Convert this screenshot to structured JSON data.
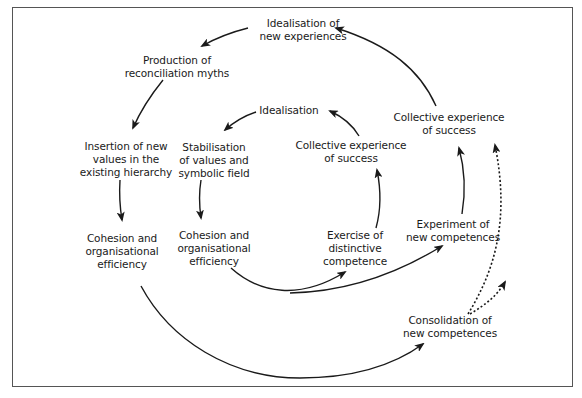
{
  "diagram": {
    "type": "cyclical process diagram (nested spirals)",
    "colors": {
      "stroke": "#1a1a1a",
      "border": "#555555",
      "background": "#ffffff"
    },
    "nodes": {
      "idealisation_new_exp": {
        "text": "Idealisation of\nnew experiences"
      },
      "production_myths": {
        "text": "Production of\nreconciliation myths"
      },
      "insertion_values": {
        "text": "Insertion of new\nvalues in the\nexisting hierarchy"
      },
      "cohesion_outer": {
        "text": "Cohesion and\norganisational\nefficiency"
      },
      "idealisation_inner": {
        "text": "Idealisation"
      },
      "stabilisation": {
        "text": "Stabilisation\nof values and\nsymbolic field"
      },
      "cohesion_inner": {
        "text": "Cohesion and\norganisational\nefficiency"
      },
      "exercise_competence": {
        "text": "Exercise of\ndistinctive\ncompetence"
      },
      "collective_inner": {
        "text": "Collective experience\nof success"
      },
      "collective_outer": {
        "text": "Collective experience\nof success"
      },
      "experiment_competences": {
        "text": "Experiment of\nnew competences"
      },
      "consolidation_competences": {
        "text": "Consolidation of\nnew competences"
      }
    },
    "edges": [
      {
        "from": "Idealisation of new experiences",
        "to": "Production of reconciliation myths",
        "style": "solid"
      },
      {
        "from": "Production of reconciliation myths",
        "to": "Insertion of new values in the existing hierarchy",
        "style": "solid"
      },
      {
        "from": "Insertion of new values in the existing hierarchy",
        "to": "Cohesion and organisational efficiency (outer)",
        "style": "solid"
      },
      {
        "from": "Cohesion and organisational efficiency (outer)",
        "to": "Consolidation of new competences",
        "style": "solid"
      },
      {
        "from": "Consolidation of new competences",
        "to": "Collective experience of success (outer)",
        "style": "dotted"
      },
      {
        "from": "Consolidation of new competences",
        "to": "outward (continuation)",
        "style": "dotted"
      },
      {
        "from": "Idealisation",
        "to": "Stabilisation of values and symbolic field",
        "style": "solid"
      },
      {
        "from": "Stabilisation of values and symbolic field",
        "to": "Cohesion and organisational efficiency (inner)",
        "style": "solid"
      },
      {
        "from": "Cohesion and organisational efficiency (inner)",
        "to": "Exercise of distinctive competence",
        "style": "solid"
      },
      {
        "from": "Cohesion and organisational efficiency (inner)",
        "to": "Experiment of new competences",
        "style": "solid"
      },
      {
        "from": "Exercise of distinctive competence",
        "to": "Collective experience of success (inner)",
        "style": "solid"
      },
      {
        "from": "Collective experience of success (inner)",
        "to": "Idealisation",
        "style": "solid"
      },
      {
        "from": "Experiment of new competences",
        "to": "Collective experience of success (outer)",
        "style": "solid"
      },
      {
        "from": "Collective experience of success (outer)",
        "to": "Idealisation of new experiences",
        "style": "solid"
      }
    ]
  }
}
